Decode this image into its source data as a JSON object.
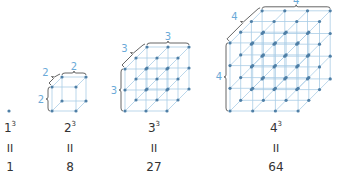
{
  "colors": {
    "grid_line": "#a9cde6",
    "dot": "#4f7fa6",
    "dimension_label": "#6aaad8",
    "brace": "#555555",
    "text": "#333333"
  },
  "cubes": [
    {
      "n": 1,
      "base": "1",
      "exponent": "3",
      "equals": "II",
      "value": "1",
      "dimension_label": ""
    },
    {
      "n": 2,
      "base": "2",
      "exponent": "3",
      "equals": "II",
      "value": "8",
      "dimension_label": "2"
    },
    {
      "n": 3,
      "base": "3",
      "exponent": "3",
      "equals": "II",
      "value": "27",
      "dimension_label": "3"
    },
    {
      "n": 4,
      "base": "4",
      "exponent": "3",
      "equals": "II",
      "value": "64",
      "dimension_label": "4"
    }
  ]
}
